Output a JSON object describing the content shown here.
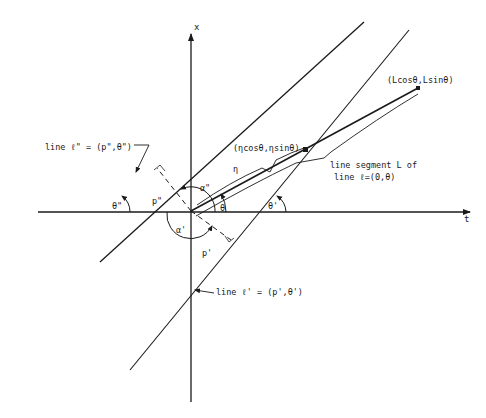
{
  "diagram": {
    "axes": {
      "vertical_label": "x",
      "horizontal_label": "t"
    },
    "labels": {
      "line_l_double_prime": "line  ℓ\" = (p\",θ\")",
      "line_l_prime": "line ℓ' = (p',θ')",
      "segment_line1": "line segment  L  of",
      "segment_line2": "line  ℓ=(0,θ)",
      "point_eta": "(ηcosθ,ηsinθ)",
      "point_L": "(Lcosθ,Lsinθ)",
      "eta": "η",
      "theta": "θ",
      "theta_prime": "θ'",
      "theta_double_prime": "θ\"",
      "alpha_prime": "α'",
      "alpha_double_prime": "α\"",
      "p_prime": "p'",
      "p_double_prime": "p\""
    },
    "colors": {
      "ink": "#1a1a1a",
      "background": "#ffffff"
    }
  }
}
